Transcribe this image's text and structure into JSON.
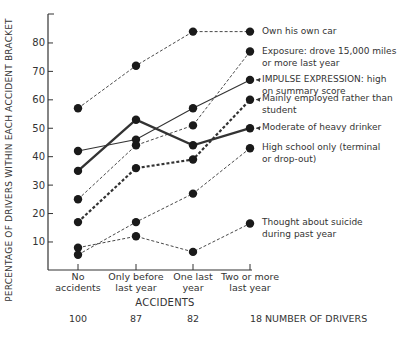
{
  "chart_data": {
    "type": "line",
    "title": "",
    "xlabel": "ACCIDENTS",
    "ylabel": "PERCENTAGE OF DRIVERS WITHIN EACH ACCIDENT BRACKET",
    "ylim": [
      0,
      90
    ],
    "yticks": [
      10,
      20,
      30,
      40,
      50,
      60,
      70,
      80
    ],
    "grid": false,
    "categories": [
      [
        "No",
        "accidents"
      ],
      [
        "Only before",
        "last year"
      ],
      [
        "One last",
        "year"
      ],
      [
        "Two or more",
        "last year"
      ]
    ],
    "driver_counts": {
      "label": "NUMBER OF DRIVERS",
      "values": [
        "100",
        "87",
        "82",
        "18"
      ]
    },
    "series": [
      {
        "name": "Own his own car",
        "label_lines": [
          "Own his own car"
        ],
        "style": "dashed-thin",
        "arrow": false,
        "values": [
          57,
          72,
          84,
          84
        ]
      },
      {
        "name": "Exposure: drove 15,000 miles or more last year",
        "label_lines": [
          "Exposure:  drove 15,000 miles",
          "or more last year"
        ],
        "style": "dashed-thin",
        "arrow": false,
        "values": [
          25,
          44,
          51,
          77
        ]
      },
      {
        "name": "IMPULSE EXPRESSION: high on summary score",
        "label_lines": [
          "IMPULSE EXPRESSION:  high",
          "on summary score"
        ],
        "style": "solid-thin",
        "arrow": true,
        "values": [
          42,
          46,
          57,
          67
        ]
      },
      {
        "name": "Mainly employed rather than student",
        "label_lines": [
          "Mainly employed rather than",
          "student"
        ],
        "style": "dashed-thick",
        "arrow": true,
        "values": [
          17,
          36,
          39,
          60
        ]
      },
      {
        "name": "Moderate of heavy drinker",
        "label_lines": [
          "Moderate of heavy drinker"
        ],
        "style": "solid-thick",
        "arrow": true,
        "values": [
          35,
          53,
          44,
          50
        ]
      },
      {
        "name": "High school only (terminal or drop-out)",
        "label_lines": [
          "High school only (terminal",
          "or drop-out)"
        ],
        "style": "dashed-thin",
        "arrow": false,
        "values": [
          5.5,
          17,
          27,
          43
        ]
      },
      {
        "name": "Thought about suicide during past year",
        "label_lines": [
          "Thought about suicide",
          "during past year"
        ],
        "style": "dashed-thin",
        "arrow": false,
        "values": [
          8,
          12,
          6.5,
          16.5
        ]
      }
    ],
    "legend": "right-of-lines"
  }
}
